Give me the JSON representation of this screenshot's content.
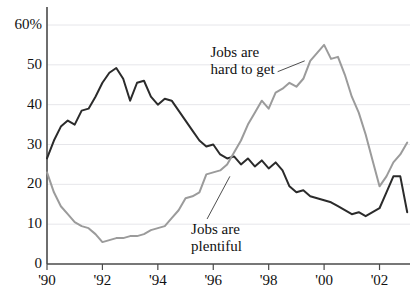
{
  "chart_data": {
    "type": "line",
    "title": "",
    "subtitle": "",
    "xlabel": "",
    "ylabel": "",
    "xlim": [
      1990.0,
      2003.1
    ],
    "ylim": [
      0,
      60
    ],
    "grid": true,
    "grid_axis": "y",
    "legend_position": "inline-annotations",
    "y_ticks": [
      0,
      10,
      20,
      30,
      40,
      50,
      60
    ],
    "y_tick_labels": [
      "0",
      "10",
      "20",
      "30",
      "40",
      "50",
      "60%"
    ],
    "x_ticks": [
      1990,
      1992,
      1994,
      1996,
      1998,
      2000,
      2002
    ],
    "x_tick_labels": [
      "'90",
      "'92",
      "'94",
      "'96",
      "'98",
      "'00",
      "'02"
    ],
    "series": [
      {
        "name": "Jobs are hard to get",
        "color": "#2b2b2b",
        "width": 2.0,
        "annotation": {
          "line1": "Jobs are",
          "line2": "hard to get",
          "x_text": 1995.9,
          "y_text": 55.2,
          "leader_to_x": 1999.3,
          "leader_to_y": 51.0
        },
        "x": [
          1990.0,
          1990.25,
          1990.5,
          1990.75,
          1991.0,
          1991.25,
          1991.5,
          1991.75,
          1992.0,
          1992.25,
          1992.5,
          1992.75,
          1993.0,
          1993.25,
          1993.5,
          1993.75,
          1994.0,
          1994.25,
          1994.5,
          1994.75,
          1995.0,
          1995.25,
          1995.5,
          1995.75,
          1996.0,
          1996.25,
          1996.5,
          1996.75,
          1997.0,
          1997.25,
          1997.5,
          1997.75,
          1998.0,
          1998.25,
          1998.5,
          1998.75,
          1999.0,
          1999.25,
          1999.5,
          1999.75,
          2000.0,
          2000.25,
          2000.5,
          2000.75,
          2001.0,
          2001.25,
          2001.5,
          2001.75,
          2002.0,
          2002.25,
          2002.5,
          2002.75,
          2003.0
        ],
        "y": [
          26.5,
          31.0,
          34.5,
          36.0,
          35.0,
          38.5,
          39.0,
          42.0,
          45.5,
          48.0,
          49.2,
          46.5,
          41.0,
          45.5,
          46.0,
          42.0,
          40.0,
          41.5,
          41.0,
          38.5,
          36.0,
          33.5,
          31.0,
          29.5,
          30.0,
          27.5,
          26.5,
          27.0,
          25.0,
          26.5,
          24.5,
          26.0,
          24.0,
          25.5,
          23.5,
          19.5,
          18.0,
          18.5,
          17.0,
          16.5,
          16.0,
          15.5,
          14.5,
          13.5,
          12.5,
          13.0,
          12.0,
          13.0,
          14.0,
          18.0,
          22.0,
          22.0,
          13.0
        ]
      },
      {
        "name": "Jobs are plentiful",
        "color": "#9b9b9b",
        "width": 2.0,
        "annotation": {
          "line1": "Jobs are",
          "line2": "plentiful",
          "x_text": 1995.2,
          "y_text": 10.8,
          "leader_to_x": 1996.6,
          "leader_to_y": 22.0
        },
        "x": [
          1990.0,
          1990.25,
          1990.5,
          1990.75,
          1991.0,
          1991.25,
          1991.5,
          1991.75,
          1992.0,
          1992.25,
          1992.5,
          1992.75,
          1993.0,
          1993.25,
          1993.5,
          1993.75,
          1994.0,
          1994.25,
          1994.5,
          1994.75,
          1995.0,
          1995.25,
          1995.5,
          1995.75,
          1996.0,
          1996.25,
          1996.5,
          1996.75,
          1997.0,
          1997.25,
          1997.5,
          1997.75,
          1998.0,
          1998.25,
          1998.5,
          1998.75,
          1999.0,
          1999.25,
          1999.5,
          1999.75,
          2000.0,
          2000.25,
          2000.5,
          2000.75,
          2001.0,
          2001.25,
          2001.5,
          2001.75,
          2002.0,
          2002.25,
          2002.5,
          2002.75,
          2003.0
        ],
        "y": [
          23.0,
          18.0,
          14.5,
          12.5,
          10.5,
          9.5,
          9.0,
          7.5,
          5.5,
          6.0,
          6.5,
          6.5,
          7.0,
          7.0,
          7.5,
          8.5,
          9.0,
          9.5,
          11.5,
          13.5,
          16.5,
          17.0,
          18.0,
          22.5,
          23.0,
          23.5,
          25.0,
          28.0,
          31.0,
          35.0,
          38.0,
          41.0,
          39.0,
          43.0,
          44.0,
          45.5,
          44.5,
          46.5,
          51.0,
          53.0,
          55.0,
          51.5,
          52.0,
          47.5,
          42.0,
          38.0,
          32.5,
          26.0,
          19.5,
          22.0,
          25.5,
          27.5,
          30.5
        ]
      }
    ]
  },
  "axes": {
    "axis_color": "#4a4a4a",
    "grid_color": "#e6e6ea",
    "tick_color": "#4a4a4a"
  }
}
